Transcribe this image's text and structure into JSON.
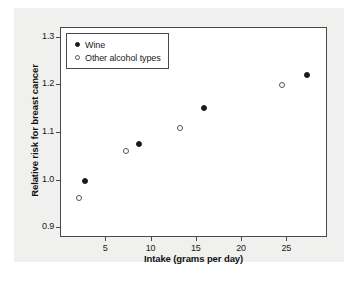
{
  "chart_data": {
    "type": "scatter",
    "title": "",
    "xlabel": "Intake (grams per day)",
    "ylabel": "Relative risk for breast cancer",
    "xlim": [
      0,
      29.5
    ],
    "ylim": [
      0.88,
      1.32
    ],
    "xticks": [
      5,
      10,
      15,
      20,
      25
    ],
    "xtick_labels": [
      "5",
      "10",
      "15",
      "20",
      "25"
    ],
    "yticks": [
      0.9,
      1.0,
      1.1,
      1.2,
      1.3
    ],
    "ytick_labels": [
      "0.9",
      "1.0",
      "1.1",
      "1.2",
      "1.3"
    ],
    "grid": false,
    "legend_position": "upper left",
    "series": [
      {
        "name": "Wine",
        "marker": "filled-circle",
        "color": "#1c1c1c",
        "points": [
          {
            "x": 2.6,
            "y": 1.0
          },
          {
            "x": 8.6,
            "y": 1.078
          },
          {
            "x": 15.8,
            "y": 1.153
          },
          {
            "x": 27.2,
            "y": 1.222
          }
        ]
      },
      {
        "name": "Other alcohol types",
        "marker": "open-circle",
        "color": "#555555",
        "points": [
          {
            "x": 2.0,
            "y": 0.963
          },
          {
            "x": 7.2,
            "y": 1.063
          },
          {
            "x": 13.2,
            "y": 1.111
          },
          {
            "x": 24.4,
            "y": 1.2
          }
        ]
      }
    ]
  }
}
